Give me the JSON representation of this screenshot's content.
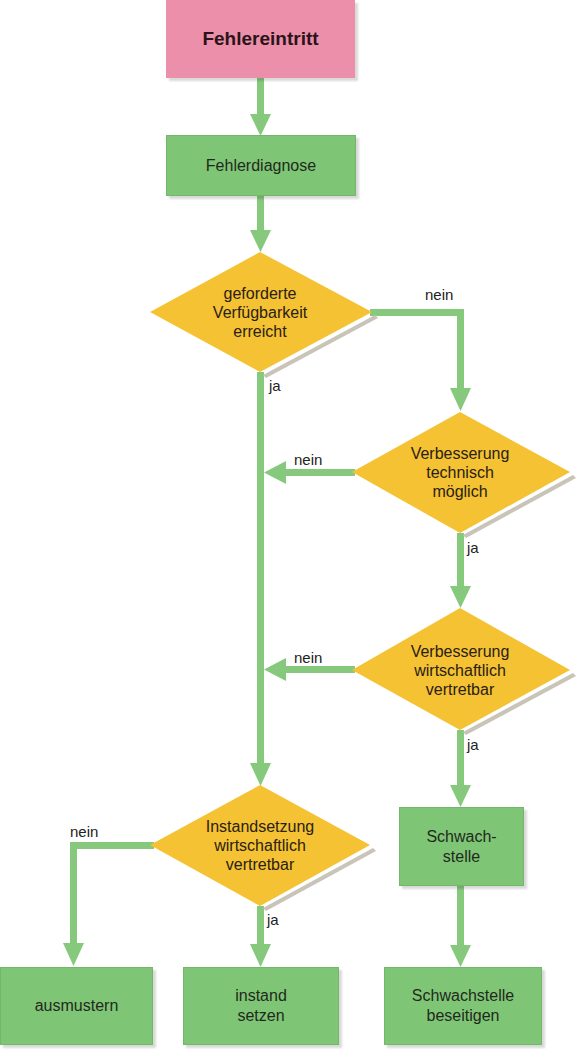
{
  "title": "Fehlereintritt",
  "nodes": {
    "start": "Fehlereintritt",
    "diagnose": "Fehlerdiagnose",
    "decision1": [
      "geforderte",
      "Verfügbarkeit",
      "erreicht"
    ],
    "decision2": [
      "Verbesserung",
      "technisch",
      "möglich"
    ],
    "decision3": [
      "Verbesserung",
      "wirtschaftlich",
      "vertretbar"
    ],
    "decision4": [
      "Instandsetzung",
      "wirtschaftlich",
      "vertretbar"
    ],
    "weakpoint": [
      "Schwach-",
      "stelle"
    ],
    "scrap": "ausmustern",
    "repair": [
      "instand",
      "setzen"
    ],
    "fix_weakpoint": [
      "Schwachstelle",
      "beseitigen"
    ]
  },
  "labels": {
    "yes": "ja",
    "no": "nein"
  },
  "colors": {
    "start": "#ec8fab",
    "process": "#7fc576",
    "decision": "#f4c232",
    "connector": "#86c97d"
  }
}
